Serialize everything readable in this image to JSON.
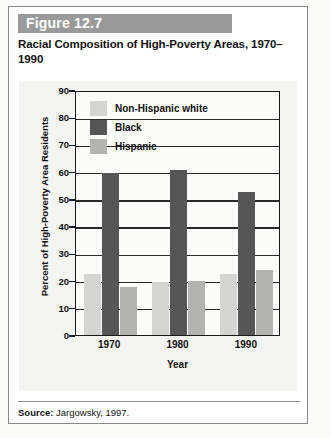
{
  "figure": {
    "banner_label": "Figure 12.7",
    "title": "Racial Composition of High-Poverty Areas, 1970–1990",
    "source_prefix": "Source:",
    "source_text": " Jargowsky, 1997."
  },
  "colors": {
    "banner_bg": "#9a9a9a",
    "non_hispanic_white": "#d4d4d2",
    "black": "#565656",
    "hispanic": "#b3b3b1",
    "axis": "#1a1a1a",
    "card_border": "#8a8a8a"
  },
  "chart_data": {
    "type": "bar",
    "title": "Racial Composition of High-Poverty Areas, 1970–1990",
    "xlabel": "Year",
    "ylabel": "Percent of High-Poverty Area Residents",
    "categories": [
      "1970",
      "1980",
      "1990"
    ],
    "ylim": [
      0,
      90
    ],
    "yticks": [
      0,
      10,
      20,
      30,
      40,
      50,
      60,
      70,
      80,
      90
    ],
    "grid": true,
    "legend_position": "top-left-inside",
    "series": [
      {
        "name": "Non-Hispanic white",
        "color": "#d4d4d2",
        "values": [
          22.5,
          19.5,
          22.5
        ]
      },
      {
        "name": "Black",
        "color": "#565656",
        "values": [
          59.5,
          60.5,
          52.5
        ]
      },
      {
        "name": "Hispanic",
        "color": "#b3b3b1",
        "values": [
          17.5,
          20.0,
          24.0
        ]
      }
    ]
  }
}
